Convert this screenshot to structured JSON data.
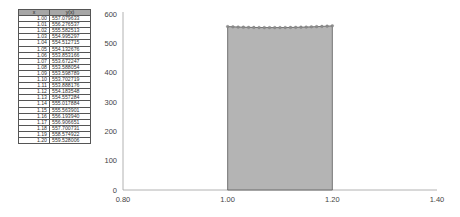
{
  "table": {
    "headers": [
      "x",
      "y(x)"
    ],
    "rows": [
      [
        "1.00",
        "557.079633"
      ],
      [
        "1.01",
        "556.276537"
      ],
      [
        "1.02",
        "555.582513"
      ],
      [
        "1.03",
        "554.995297"
      ],
      [
        "1.04",
        "554.512715"
      ],
      [
        "1.05",
        "554.132676"
      ],
      [
        "1.06",
        "553.853166"
      ],
      [
        "1.07",
        "553.672247"
      ],
      [
        "1.08",
        "553.588054"
      ],
      [
        "1.09",
        "553.598789"
      ],
      [
        "1.10",
        "553.702719"
      ],
      [
        "1.11",
        "553.888176"
      ],
      [
        "1.12",
        "554.183548"
      ],
      [
        "1.13",
        "554.557284"
      ],
      [
        "1.14",
        "555.017884"
      ],
      [
        "1.15",
        "555.563901"
      ],
      [
        "1.16",
        "556.193940"
      ],
      [
        "1.17",
        "556.906651"
      ],
      [
        "1.18",
        "557.700731"
      ],
      [
        "1.19",
        "558.574922"
      ],
      [
        "1.20",
        "559.528006"
      ]
    ]
  },
  "colors": {
    "area_fill": "#b4b4b4",
    "area_outline": "#595959",
    "marker": "#8c8c8c",
    "axis": "#a0a0a0",
    "header_bg": "#a6a6a6"
  },
  "chart_data": {
    "type": "area",
    "title": "",
    "xlabel": "",
    "ylabel": "",
    "x": [
      1.0,
      1.01,
      1.02,
      1.03,
      1.04,
      1.05,
      1.06,
      1.07,
      1.08,
      1.09,
      1.1,
      1.11,
      1.12,
      1.13,
      1.14,
      1.15,
      1.16,
      1.17,
      1.18,
      1.19,
      1.2
    ],
    "series": [
      {
        "name": "y(x)",
        "values": [
          557.079633,
          556.276537,
          555.582513,
          554.995297,
          554.512715,
          554.132676,
          553.853166,
          553.672247,
          553.588054,
          553.598789,
          553.702719,
          553.888176,
          554.183548,
          554.557284,
          555.017884,
          555.563901,
          556.19394,
          556.906651,
          557.700731,
          558.574922,
          559.528006
        ]
      }
    ],
    "xlim": [
      0.8,
      1.4
    ],
    "ylim": [
      0,
      600
    ],
    "xticks": [
      "0.80",
      "1.00",
      "1.20",
      "1.40"
    ],
    "yticks": [
      "0",
      "100",
      "200",
      "300",
      "400",
      "500",
      "600"
    ],
    "grid": false,
    "legend": "none"
  }
}
